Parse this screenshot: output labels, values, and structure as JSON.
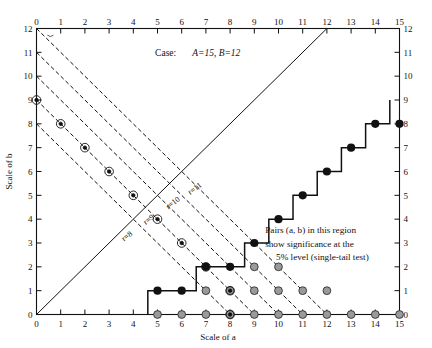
{
  "figure": {
    "case_label": "Case:",
    "case_values": "A=15, B=12",
    "note_line1": "Pairs (a, b) in this region",
    "note_line2": "show significance at the",
    "note_line3": "5% level (single-tail test)"
  },
  "chart_data": {
    "type": "scatter",
    "xlabel": "Scale of a",
    "ylabel": "Scale of b",
    "xlim": [
      0,
      15
    ],
    "ylim": [
      0,
      12
    ],
    "grid": false,
    "xticks": [
      0,
      1,
      2,
      3,
      4,
      5,
      6,
      7,
      8,
      9,
      10,
      11,
      12,
      13,
      14,
      15
    ],
    "yticks": [
      0,
      1,
      2,
      3,
      4,
      5,
      6,
      7,
      8,
      9,
      10,
      11,
      12
    ],
    "xticklabels": [
      "0",
      "1",
      "2",
      "3",
      "4",
      "5",
      "6",
      "7",
      "8",
      "9",
      "10",
      "11",
      "12",
      "13",
      "14",
      "15"
    ],
    "yticklabels": [
      "0",
      "1",
      "2",
      "3",
      "4",
      "5",
      "6",
      "7",
      "8",
      "9",
      "10",
      "11",
      "12"
    ],
    "axes_mirrored": {
      "top": true,
      "right": true
    },
    "annotations": [
      {
        "text": "r=11",
        "x": 6.6,
        "y": 5.2,
        "rotation": -37
      },
      {
        "text": "r=10",
        "x": 5.7,
        "y": 4.6,
        "rotation": -37
      },
      {
        "text": "r=9",
        "x": 4.7,
        "y": 3.9,
        "rotation": -37
      },
      {
        "text": "r=8",
        "x": 3.8,
        "y": 3.2,
        "rotation": -37
      },
      {
        "text": "Pairs (a, b) in this region",
        "x": 9.6,
        "y": 3.3,
        "rotation": 0
      },
      {
        "text": "show significance at the",
        "x": 9.6,
        "y": 2.75,
        "rotation": 0
      },
      {
        "text": "5% level (single-tail test)",
        "x": 10.0,
        "y": 2.2,
        "rotation": 0
      }
    ],
    "series": [
      {
        "name": "r-constant dashed lines (a+b=r)",
        "style": "dashed",
        "lines": [
          {
            "label": "r=8",
            "x": [
              0,
              8
            ],
            "y": [
              8,
              0
            ]
          },
          {
            "label": "r=9",
            "x": [
              0,
              9
            ],
            "y": [
              9,
              0
            ]
          },
          {
            "label": "r=10",
            "x": [
              0,
              10
            ],
            "y": [
              10,
              0
            ]
          },
          {
            "label": "r=11",
            "x": [
              0,
              11
            ],
            "y": [
              11,
              0
            ]
          },
          {
            "label": "r=12",
            "x": [
              0,
              12
            ],
            "y": [
              12,
              0
            ]
          }
        ]
      },
      {
        "name": "identity diagonal b=a",
        "style": "solid",
        "lines": [
          {
            "label": "b=a",
            "x": [
              0,
              12
            ],
            "y": [
              0,
              12
            ]
          }
        ]
      },
      {
        "name": "5% significance staircase boundary",
        "style": "solid-thick",
        "points": [
          [
            4.6,
            0
          ],
          [
            4.6,
            1
          ],
          [
            6.6,
            1
          ],
          [
            6.6,
            2
          ],
          [
            8.6,
            2
          ],
          [
            8.6,
            3
          ],
          [
            9.6,
            3
          ],
          [
            9.6,
            4
          ],
          [
            10.6,
            4
          ],
          [
            10.6,
            5
          ],
          [
            11.6,
            5
          ],
          [
            11.6,
            6
          ],
          [
            12.6,
            6
          ],
          [
            12.6,
            7
          ],
          [
            13.6,
            7
          ],
          [
            13.6,
            8
          ],
          [
            14.6,
            8
          ],
          [
            14.6,
            9
          ]
        ]
      },
      {
        "name": "significant points (filled)",
        "marker": "filled-circle",
        "points": [
          [
            5,
            1
          ],
          [
            6,
            1
          ],
          [
            7,
            2
          ],
          [
            8,
            2
          ],
          [
            9,
            3
          ],
          [
            10,
            4
          ],
          [
            11,
            5
          ],
          [
            12,
            6
          ],
          [
            13,
            7
          ],
          [
            14,
            8
          ],
          [
            15,
            8
          ]
        ]
      },
      {
        "name": "non-significant points (gray)",
        "marker": "gray-circle",
        "points": [
          [
            5,
            0
          ],
          [
            6,
            0
          ],
          [
            7,
            0
          ],
          [
            8,
            0
          ],
          [
            9,
            0
          ],
          [
            10,
            0
          ],
          [
            11,
            0
          ],
          [
            12,
            0
          ],
          [
            13,
            0
          ],
          [
            14,
            0
          ],
          [
            15,
            0
          ],
          [
            7,
            1
          ],
          [
            8,
            1
          ],
          [
            9,
            1
          ],
          [
            10,
            1
          ],
          [
            11,
            1
          ],
          [
            12,
            1
          ],
          [
            9,
            2
          ],
          [
            10,
            2
          ]
        ]
      },
      {
        "name": "ringed sample points on r-lines",
        "marker": "ringed-circle",
        "points": [
          [
            0,
            9
          ],
          [
            1,
            8
          ],
          [
            2,
            7
          ],
          [
            3,
            6
          ],
          [
            4,
            5
          ],
          [
            5,
            4
          ],
          [
            6,
            3
          ],
          [
            7,
            2
          ],
          [
            8,
            1
          ],
          [
            8,
            0
          ]
        ]
      }
    ]
  }
}
